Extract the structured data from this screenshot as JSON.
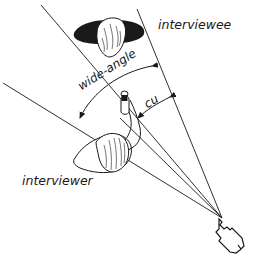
{
  "diagram": {
    "labels": {
      "interviewee": "interviewee",
      "interviewer": "interviewer",
      "wide_angle": "wide-angle",
      "close_up": "cu"
    },
    "elements": [
      {
        "name": "interviewee-head",
        "description": "top-down view of interviewee's head and shoulders"
      },
      {
        "name": "interviewer-head",
        "description": "top-down view of interviewer's head and shoulder with raised arm holding microphone"
      },
      {
        "name": "camera",
        "description": "camera seen from above, bottom right"
      },
      {
        "name": "wide-angle-field",
        "description": "outer sight lines from camera showing wide-angle field of view"
      },
      {
        "name": "close-up-field",
        "description": "inner sight lines from camera showing close-up field of view"
      },
      {
        "name": "wide-angle-arc",
        "description": "double-headed arc arrow spanning wide-angle field"
      },
      {
        "name": "cu-arc",
        "description": "double-headed arc arrow spanning close-up field"
      }
    ],
    "colors": {
      "ink": "#1a1a1a",
      "background": "#ffffff"
    }
  }
}
